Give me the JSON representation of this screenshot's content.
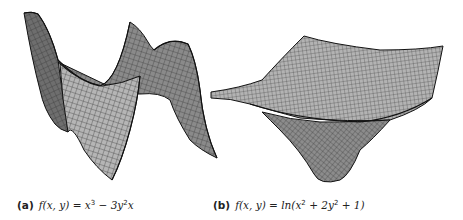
{
  "figure": {
    "panels": [
      {
        "tag": "(a)",
        "function_lhs": "f(x, y)",
        "equals": " = ",
        "expression_parts": [
          "x",
          "3",
          " − 3y",
          "2",
          "x"
        ],
        "description": "monkey-saddle-like surface plot f(x,y) = x^3 - 3y^2 x"
      },
      {
        "tag": "(b)",
        "function_lhs": "f(x, y)",
        "equals": " = ",
        "expression_parts": [
          "ln(x",
          "2",
          " + 2y",
          "2",
          " + 1)"
        ],
        "description": "bowl-like surface plot f(x,y) = ln(x^2 + 2y^2 + 1)"
      }
    ],
    "colors": {
      "surface_fill_light": "#b8b8b8",
      "surface_fill_dark": "#7a7a7a",
      "mesh_line": "#2a2a2a",
      "outline": "#111111"
    }
  }
}
